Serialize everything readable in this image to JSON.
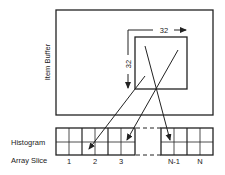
{
  "diagram": {
    "buffer_label": "Item Buffer",
    "tile_width_label": "32",
    "tile_height_label": "32",
    "histogram_label": "Histogram",
    "array_slice_label": "Array Slice",
    "slices": [
      "1",
      "2",
      "3",
      "N-1",
      "N"
    ],
    "colors": {
      "stroke": "#222222",
      "background": "#ffffff"
    }
  }
}
